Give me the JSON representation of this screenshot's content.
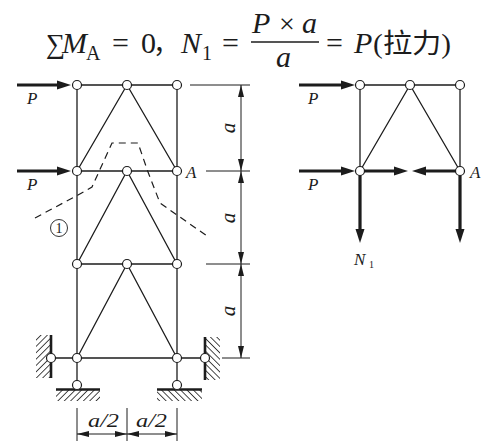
{
  "colors": {
    "ink": "#1c1c1c",
    "background": "#ffffff"
  },
  "formula": {
    "sum": "∑",
    "moment": "M",
    "moment_sub": "A",
    "equals": "=",
    "zero": "0",
    "separator": "，",
    "force": "N",
    "force_sub": "1",
    "numerator_p": "P",
    "times": "×",
    "numerator_a": "a",
    "denominator": "a",
    "result": "P",
    "note": "(拉力)"
  },
  "left_diagram": {
    "loads": [
      "P",
      "P"
    ],
    "node_label": "A",
    "cut_label": "1",
    "vertical_dimensions": [
      "a",
      "a",
      "a"
    ],
    "horizontal_dimensions": [
      "a/2",
      "a/2"
    ]
  },
  "right_diagram": {
    "loads": [
      "P",
      "P"
    ],
    "node_label": "A",
    "member_force": "N",
    "member_force_sub": "1"
  }
}
